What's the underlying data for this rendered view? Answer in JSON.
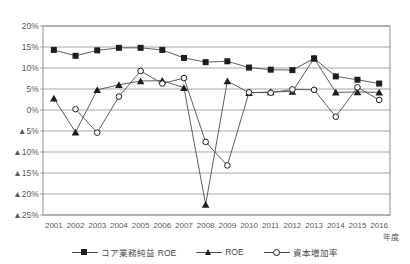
{
  "chart_data": {
    "type": "line",
    "title": "",
    "xlabel": "年度",
    "ylabel": "",
    "categories": [
      "2001",
      "2002",
      "2003",
      "2004",
      "2005",
      "2006",
      "2007",
      "2008",
      "2009",
      "2010",
      "2011",
      "2012",
      "2013",
      "2014",
      "2015",
      "2016"
    ],
    "ytick_labels": [
      "20%",
      "15%",
      "10%",
      "5%",
      "0%",
      "▲5%",
      "▲10%",
      "▲15%",
      "▲20%",
      "▲25%"
    ],
    "ytick_values": [
      20,
      15,
      10,
      5,
      0,
      -5,
      -10,
      -15,
      -20,
      -25
    ],
    "ylim": [
      -25,
      20
    ],
    "grid": true,
    "legend_position": "bottom",
    "series": [
      {
        "name": "コア業務純益 ROE",
        "marker": "filled-square",
        "values": [
          14.3,
          12.9,
          14.2,
          14.8,
          14.8,
          14.3,
          12.4,
          11.4,
          11.6,
          10.1,
          9.6,
          9.5,
          12.3,
          8.0,
          7.2,
          6.3
        ]
      },
      {
        "name": "ROE",
        "marker": "filled-triangle",
        "values": [
          2.8,
          -5.3,
          4.8,
          6.0,
          6.9,
          7.0,
          5.3,
          -22.5,
          6.9,
          4.1,
          4.3,
          4.4,
          12.3,
          4.2,
          4.3,
          4.2
        ]
      },
      {
        "name": "資本増加率",
        "marker": "open-circle",
        "values": [
          null,
          0.2,
          -5.4,
          3.2,
          9.3,
          6.3,
          7.6,
          -7.6,
          -13.2,
          4.2,
          4.1,
          4.9,
          4.8,
          -1.6,
          5.4,
          2.4
        ]
      }
    ]
  },
  "legend": {
    "items": [
      {
        "label": "コア業務純益 ROE",
        "marker": "filled-square"
      },
      {
        "label": "ROE",
        "marker": "filled-triangle"
      },
      {
        "label": "資本増加率",
        "marker": "open-circle"
      }
    ]
  },
  "colors": {
    "line": "#4d4d48",
    "marker": "#1d1d1b",
    "grid": "#8f8f8a",
    "border": "#8f8f8a",
    "text": "#5a5a55",
    "background": "#ffffff"
  }
}
